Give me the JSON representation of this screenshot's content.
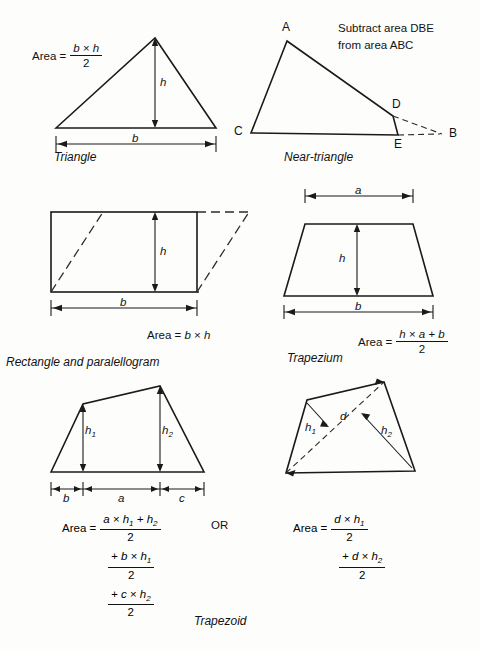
{
  "page": {
    "background": "#fdfdfc",
    "ink": "#1a1a1a",
    "width": 480,
    "height": 649
  },
  "figures": [
    {
      "id": "triangle",
      "caption": "Triangle",
      "dimension_labels": [
        "h",
        "b"
      ],
      "formula": {
        "lhs": "Area =",
        "numerator": "b × h",
        "denominator": "2"
      }
    },
    {
      "id": "near-triangle",
      "caption": "Near-triangle",
      "note": "Subtract area DBE\nfrom area ABC",
      "vertices": [
        "A",
        "B",
        "C",
        "D",
        "E"
      ]
    },
    {
      "id": "rectangle-parallelogram",
      "caption": "Rectangle and paralellogram",
      "dimension_labels": [
        "h",
        "b"
      ],
      "formula": {
        "lhs": "Area =",
        "inline": "b × h"
      }
    },
    {
      "id": "trapezium",
      "caption": "Trapezium",
      "dimension_labels": [
        "a",
        "h",
        "b"
      ],
      "formula": {
        "lhs": "Area =",
        "numerator": "h × a + b",
        "denominator": "2"
      }
    },
    {
      "id": "trapezoid-left",
      "caption": "Trapezoid",
      "dimension_labels": [
        "h1",
        "h2",
        "b",
        "a",
        "c"
      ],
      "formula_terms": [
        {
          "lhs": "Area =",
          "numerator": "a × h₁ + h₂",
          "denominator": "2"
        },
        {
          "lhs": "",
          "numerator": "+ b × h₁",
          "denominator": "2"
        },
        {
          "lhs": "",
          "numerator": "+ c × h₂",
          "denominator": "2"
        }
      ],
      "connector": "OR"
    },
    {
      "id": "trapezoid-right",
      "dimension_labels": [
        "h1",
        "d",
        "h2"
      ],
      "formula_terms": [
        {
          "lhs": "Area =",
          "numerator": "d × h₁",
          "denominator": "2"
        },
        {
          "lhs": "",
          "numerator": "+ d × h₂",
          "denominator": "2"
        }
      ]
    }
  ],
  "labels": {
    "area_word": "Area",
    "equals": "=",
    "times": "×",
    "two": "2",
    "plus": "+",
    "or": "OR"
  },
  "text": {
    "triangle_caption": "Triangle",
    "near_triangle_caption": "Near-triangle",
    "near_triangle_note_line1": "Subtract area DBE",
    "near_triangle_note_line2": "from area ABC",
    "rect_caption": "Rectangle and paralellogram",
    "rect_area": "Area = b × h",
    "trapezium_caption": "Trapezium",
    "trapezoid_caption": "Trapezoid",
    "vertex_a": "A",
    "vertex_b": "B",
    "vertex_c": "C",
    "vertex_d": "D",
    "vertex_e": "E",
    "dim_b": "b",
    "dim_h": "h",
    "dim_a": "a",
    "dim_c": "c",
    "dim_d": "d",
    "dim_h1": "h",
    "dim_h1_sub": "1",
    "dim_h2": "h",
    "dim_h2_sub": "2",
    "num_tri": "b × h",
    "num_trapezium": "h × a + b",
    "num_tz1": "a × h",
    "num_tz1_sub1": "1",
    "num_tz1_mid": " + h",
    "num_tz1_sub2": "2",
    "num_tz2": "+ b × h",
    "num_tz2_sub": "1",
    "num_tz3": "+ c × h",
    "num_tz3_sub": "2",
    "num_tr1": "d × h",
    "num_tr1_sub": "1",
    "num_tr2": "+ d × h",
    "num_tr2_sub": "2"
  }
}
